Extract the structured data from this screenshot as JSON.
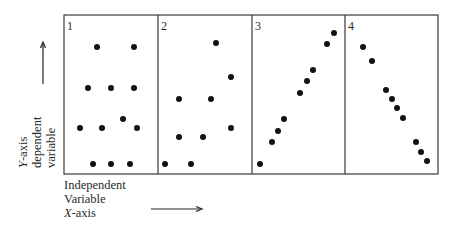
{
  "figure": {
    "panels": [
      {
        "label": "1",
        "pattern": "no correlation",
        "points": [
          [
            97,
            47
          ],
          [
            134,
            47
          ],
          [
            88,
            88
          ],
          [
            111,
            88
          ],
          [
            134,
            88
          ],
          [
            80,
            128
          ],
          [
            102,
            128
          ],
          [
            123,
            119
          ],
          [
            137,
            128
          ],
          [
            93,
            164
          ],
          [
            111,
            164
          ],
          [
            130,
            164
          ]
        ]
      },
      {
        "label": "2",
        "pattern": "weak positive",
        "points": [
          [
            216,
            43
          ],
          [
            231,
            77
          ],
          [
            179,
            99
          ],
          [
            211,
            99
          ],
          [
            231,
            128
          ],
          [
            179,
            137
          ],
          [
            203,
            137
          ],
          [
            165,
            164
          ],
          [
            191,
            164
          ]
        ]
      },
      {
        "label": "3",
        "pattern": "strong positive",
        "points": [
          [
            260,
            164
          ],
          [
            272,
            142
          ],
          [
            278,
            131
          ],
          [
            284,
            119
          ],
          [
            300,
            93
          ],
          [
            307,
            81
          ],
          [
            313,
            70
          ],
          [
            327,
            44
          ],
          [
            334,
            33
          ]
        ]
      },
      {
        "label": "4",
        "pattern": "strong negative",
        "points": [
          [
            363,
            47
          ],
          [
            372,
            61
          ],
          [
            386,
            90
          ],
          [
            392,
            99
          ],
          [
            397,
            108
          ],
          [
            403,
            118
          ],
          [
            416,
            142
          ],
          [
            421,
            152
          ],
          [
            427,
            161
          ]
        ]
      }
    ],
    "y_axis_label": {
      "line1": "Y-axis",
      "line1_italic": "Y",
      "line1_rest": "-axis",
      "line2": "dependent",
      "line3": "variable"
    },
    "x_axis_label": {
      "line1": "Independent",
      "line2": "Variable",
      "line3_italic": "X",
      "line3_rest": "-axis"
    }
  }
}
